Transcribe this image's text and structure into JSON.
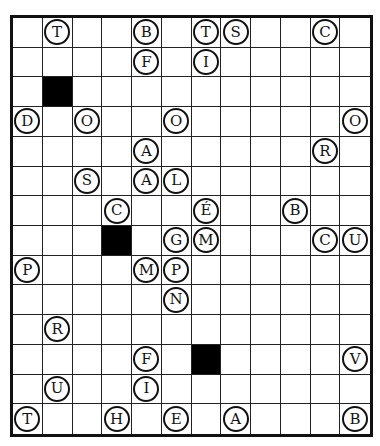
{
  "puzzle": {
    "rows": 14,
    "cols": 12,
    "colors": {
      "grid_line": "#222222",
      "black_cell": "#000000",
      "background": "#ffffff"
    },
    "black_cells": [
      {
        "row": 3,
        "col": 2
      },
      {
        "row": 8,
        "col": 4
      },
      {
        "row": 12,
        "col": 7
      }
    ],
    "letters": [
      {
        "row": 1,
        "col": 2,
        "letter": "T"
      },
      {
        "row": 1,
        "col": 5,
        "letter": "B"
      },
      {
        "row": 1,
        "col": 7,
        "letter": "T"
      },
      {
        "row": 1,
        "col": 8,
        "letter": "S"
      },
      {
        "row": 1,
        "col": 11,
        "letter": "C"
      },
      {
        "row": 2,
        "col": 5,
        "letter": "F"
      },
      {
        "row": 2,
        "col": 7,
        "letter": "I"
      },
      {
        "row": 4,
        "col": 1,
        "letter": "D"
      },
      {
        "row": 4,
        "col": 3,
        "letter": "O"
      },
      {
        "row": 4,
        "col": 6,
        "letter": "O"
      },
      {
        "row": 4,
        "col": 12,
        "letter": "O"
      },
      {
        "row": 5,
        "col": 5,
        "letter": "A"
      },
      {
        "row": 5,
        "col": 11,
        "letter": "R"
      },
      {
        "row": 6,
        "col": 3,
        "letter": "S"
      },
      {
        "row": 6,
        "col": 5,
        "letter": "A"
      },
      {
        "row": 6,
        "col": 6,
        "letter": "L"
      },
      {
        "row": 7,
        "col": 4,
        "letter": "C"
      },
      {
        "row": 7,
        "col": 7,
        "letter": "É"
      },
      {
        "row": 7,
        "col": 10,
        "letter": "B"
      },
      {
        "row": 8,
        "col": 6,
        "letter": "G"
      },
      {
        "row": 8,
        "col": 7,
        "letter": "M"
      },
      {
        "row": 8,
        "col": 11,
        "letter": "C"
      },
      {
        "row": 8,
        "col": 12,
        "letter": "U"
      },
      {
        "row": 9,
        "col": 1,
        "letter": "P"
      },
      {
        "row": 9,
        "col": 5,
        "letter": "M"
      },
      {
        "row": 9,
        "col": 6,
        "letter": "P"
      },
      {
        "row": 10,
        "col": 6,
        "letter": "N"
      },
      {
        "row": 11,
        "col": 2,
        "letter": "R"
      },
      {
        "row": 12,
        "col": 5,
        "letter": "F"
      },
      {
        "row": 12,
        "col": 12,
        "letter": "V"
      },
      {
        "row": 13,
        "col": 2,
        "letter": "U"
      },
      {
        "row": 13,
        "col": 5,
        "letter": "I"
      },
      {
        "row": 14,
        "col": 1,
        "letter": "T"
      },
      {
        "row": 14,
        "col": 4,
        "letter": "H"
      },
      {
        "row": 14,
        "col": 6,
        "letter": "E"
      },
      {
        "row": 14,
        "col": 8,
        "letter": "A"
      },
      {
        "row": 14,
        "col": 12,
        "letter": "B"
      }
    ]
  }
}
